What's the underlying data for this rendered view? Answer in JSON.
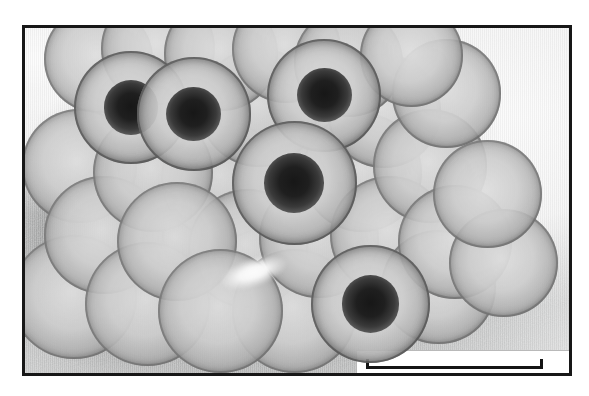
{
  "figure": {
    "kind": "transmission-electron-micrograph",
    "caption": "",
    "background_color": "#ffffff",
    "frame_color": "#171717",
    "plate_tone": "grayscale"
  },
  "micrograph": {
    "stain": "negative stain",
    "particle_count_visible": 26,
    "particle_appearance": "round capsids with granular capsomer texture; several show dark stain-penetrated cores",
    "mean_particle_diameter_px": 96,
    "particles": [
      {
        "id": "p01",
        "cx": 13.5,
        "cy": 9.0,
        "d": 20.0,
        "dark_core": false
      },
      {
        "id": "p02",
        "cx": 24.5,
        "cy": 6.0,
        "d": 21.0,
        "dark_core": false
      },
      {
        "id": "p03",
        "cx": 36.0,
        "cy": 7.5,
        "d": 21.0,
        "dark_core": false
      },
      {
        "id": "p04",
        "cx": 48.0,
        "cy": 6.0,
        "d": 20.0,
        "dark_core": false
      },
      {
        "id": "p05",
        "cx": 59.5,
        "cy": 10.0,
        "d": 20.0,
        "dark_core": false
      },
      {
        "id": "p06",
        "cx": 71.0,
        "cy": 8.0,
        "d": 19.0,
        "dark_core": false
      },
      {
        "id": "p07",
        "cx": 19.5,
        "cy": 23.0,
        "d": 21.0,
        "dark_core": true
      },
      {
        "id": "p08",
        "cx": 31.0,
        "cy": 25.0,
        "d": 21.0,
        "dark_core": true
      },
      {
        "id": "p09",
        "cx": 43.0,
        "cy": 23.0,
        "d": 22.0,
        "dark_core": false
      },
      {
        "id": "p10",
        "cx": 55.0,
        "cy": 19.5,
        "d": 21.0,
        "dark_core": true
      },
      {
        "id": "p11",
        "cx": 66.0,
        "cy": 24.0,
        "d": 21.0,
        "dark_core": false
      },
      {
        "id": "p12",
        "cx": 77.5,
        "cy": 19.0,
        "d": 20.0,
        "dark_core": false
      },
      {
        "id": "p13",
        "cx": 10.0,
        "cy": 40.0,
        "d": 21.0,
        "dark_core": false
      },
      {
        "id": "p14",
        "cx": 23.5,
        "cy": 42.0,
        "d": 22.0,
        "dark_core": false
      },
      {
        "id": "p15",
        "cx": 36.0,
        "cy": 44.0,
        "d": 22.0,
        "dark_core": false
      },
      {
        "id": "p16",
        "cx": 49.5,
        "cy": 45.0,
        "d": 23.0,
        "dark_core": true
      },
      {
        "id": "p17",
        "cx": 62.0,
        "cy": 42.0,
        "d": 22.0,
        "dark_core": false
      },
      {
        "id": "p18",
        "cx": 74.5,
        "cy": 40.0,
        "d": 21.0,
        "dark_core": false
      },
      {
        "id": "p19",
        "cx": 85.0,
        "cy": 48.0,
        "d": 20.0,
        "dark_core": false
      },
      {
        "id": "p20",
        "cx": 14.5,
        "cy": 60.0,
        "d": 22.0,
        "dark_core": false
      },
      {
        "id": "p21",
        "cx": 28.0,
        "cy": 62.0,
        "d": 22.0,
        "dark_core": false
      },
      {
        "id": "p22",
        "cx": 41.0,
        "cy": 64.0,
        "d": 22.0,
        "dark_core": false
      },
      {
        "id": "p23",
        "cx": 54.0,
        "cy": 61.0,
        "d": 22.0,
        "dark_core": false
      },
      {
        "id": "p24",
        "cx": 67.0,
        "cy": 60.0,
        "d": 22.0,
        "dark_core": false
      },
      {
        "id": "p25",
        "cx": 79.0,
        "cy": 62.0,
        "d": 21.0,
        "dark_core": false
      },
      {
        "id": "p26",
        "cx": 9.0,
        "cy": 78.0,
        "d": 23.0,
        "dark_core": false
      },
      {
        "id": "p27",
        "cx": 22.5,
        "cy": 80.0,
        "d": 23.0,
        "dark_core": false
      },
      {
        "id": "p28",
        "cx": 36.0,
        "cy": 82.0,
        "d": 23.0,
        "dark_core": false
      },
      {
        "id": "p29",
        "cx": 49.5,
        "cy": 82.0,
        "d": 23.0,
        "dark_core": false
      },
      {
        "id": "p30",
        "cx": 63.5,
        "cy": 80.0,
        "d": 22.0,
        "dark_core": true
      },
      {
        "id": "p31",
        "cx": 76.0,
        "cy": 75.0,
        "d": 21.0,
        "dark_core": false
      },
      {
        "id": "p32",
        "cx": 88.0,
        "cy": 68.0,
        "d": 20.0,
        "dark_core": false
      }
    ],
    "lucent_wedge": {
      "cx": 42.0,
      "cy": 71.0,
      "w": 13.0,
      "h": 8.5
    }
  },
  "scale_bar": {
    "present": true,
    "label": "",
    "box_background": "#ffffff",
    "bar_color": "#141414",
    "position": "bottom-right",
    "bar_length_px": 177,
    "has_end_caps": true
  }
}
